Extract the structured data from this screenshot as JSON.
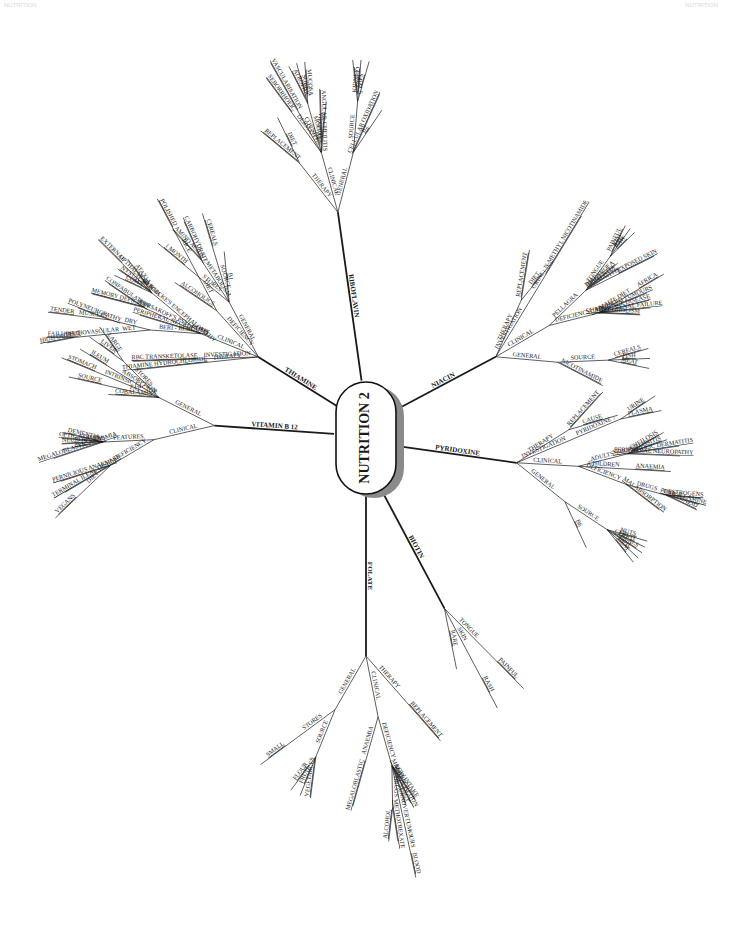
{
  "page": {
    "header_left": "NUTRITION",
    "header_right": "NUTRITION"
  },
  "center": {
    "label": "NUTRITION 2"
  },
  "branches": [
    {
      "label": "THIAMINE",
      "children": [
        {
          "label": "GENERAL",
          "children": [
            {
              "label": "B1"
            },
            {
              "label": "SOURCE",
              "children": [
                {
                  "label": "CEREALS"
                }
              ]
            },
            {
              "label": "METABOLISM",
              "children": [
                {
                  "label": "CARBOHYDRATE"
                },
                {
                  "label": "AMINO ACIDS"
                }
              ]
            },
            {
              "label": "STORES",
              "children": [
                {
                  "label": "1 MONTH"
                }
              ]
            }
          ]
        },
        {
          "label": "DEFICIENCY",
          "children": [
            {
              "label": "DIET",
              "children": [
                {
                  "label": "RICE",
                  "children": [
                    {
                      "label": "POLISHED"
                    }
                  ]
                }
              ]
            },
            {
              "label": "ALCOHOLICS"
            }
          ]
        },
        {
          "label": "CLINICAL",
          "children": [
            {
              "label": "WERNICKE'S ENCEPHALOPATHY",
              "children": [
                {
                  "label": "ATAXIA"
                },
                {
                  "label": "OPTHALMOPLEGIA",
                  "children": [
                    {
                      "label": "EXTERNAL"
                    }
                  ]
                },
                {
                  "label": "NYSTAGMUS"
                },
                {
                  "label": "COMA"
                }
              ]
            },
            {
              "label": "KORSAKOFF'S PSYCHOSIS",
              "children": [
                {
                  "label": "CONFABULATION"
                },
                {
                  "label": "MEMORY DEFICITS"
                }
              ]
            },
            {
              "label": "PERIPHERAL NEUROPATHY"
            },
            {
              "label": "BERI - BERI",
              "children": [
                {
                  "label": "DRY",
                  "children": [
                    {
                      "label": "POLYNEUROPATHY"
                    },
                    {
                      "label": "MUSCLES",
                      "children": [
                        {
                          "label": "TENDER"
                        }
                      ]
                    }
                  ]
                },
                {
                  "label": "WET",
                  "children": [
                    {
                      "label": "CARDIOVASCULAR",
                      "children": [
                        {
                          "label": "FAILURE"
                        },
                        {
                          "label": "HIGH OUTPUT"
                        }
                      ]
                    }
                  ]
                }
              ]
            }
          ]
        },
        {
          "label": "INVESTIGATION",
          "children": [
            {
              "label": "RBC TRANSKETOLASE"
            }
          ]
        },
        {
          "label": "THERAPY",
          "children": [
            {
              "label": "THIAMINE HYDROCHLORIDE"
            }
          ]
        }
      ]
    },
    {
      "label": "RIBOFLAVIN",
      "children": [
        {
          "label": "GENERAL",
          "children": [
            {
              "label": "B2"
            },
            {
              "label": "CELLULAR OXIDATION"
            },
            {
              "label": "SOURCE",
              "children": [
                {
                  "label": "FATS"
                },
                {
                  "label": "KIDNEY"
                },
                {
                  "label": "CEREALS"
                }
              ]
            }
          ]
        },
        {
          "label": "CLINICAL",
          "children": [
            {
              "label": "ANAEMIA"
            },
            {
              "label": "ANGULAR CHEILITIS"
            },
            {
              "label": "MOUTH",
              "children": [
                {
                  "label": "MUCOSA"
                },
                {
                  "label": "SORE"
                },
                {
                  "label": "ATROPHIC"
                }
              ]
            },
            {
              "label": "CORNEA",
              "children": [
                {
                  "label": "VASCULARISATION"
                }
              ]
            },
            {
              "label": "DERMATITIS",
              "children": [
                {
                  "label": "SEBORRHOEIC"
                }
              ]
            }
          ]
        },
        {
          "label": "THERAPY",
          "children": [
            {
              "label": "DIET"
            },
            {
              "label": "REPLACEMENT"
            }
          ]
        }
      ]
    },
    {
      "label": "NIACIN",
      "children": [
        {
          "label": "GENERAL",
          "children": [
            {
              "label": "NICOTINAMIDE"
            },
            {
              "label": "SOURCE",
              "children": [
                {
                  "label": "MEAT"
                },
                {
                  "label": "FISH"
                },
                {
                  "label": "CEREALS"
                }
              ]
            }
          ]
        },
        {
          "label": "CLINICAL",
          "children": [
            {
              "label": "DEFICIENCY",
              "children": [
                {
                  "label": "ALCOHOLISM"
                },
                {
                  "label": "CHRONIC RENAL FAILURE"
                },
                {
                  "label": "HARTNUP DISEASE"
                },
                {
                  "label": "CARCINOID TUMOURS"
                },
                {
                  "label": "MAIZE DIET",
                  "children": [
                    {
                      "label": "AFRICA"
                    }
                  ]
                }
              ]
            },
            {
              "label": "PELLAGRA",
              "children": [
                {
                  "label": "DERMATITIS",
                  "children": [
                    {
                      "label": "EXPOSED SKIN"
                    }
                  ]
                },
                {
                  "label": "DEMENTIA"
                },
                {
                  "label": "DIARRHOEA"
                },
                {
                  "label": "TONGUE",
                  "children": [
                    {
                      "label": "RAW"
                    },
                    {
                      "label": "RED"
                    },
                    {
                      "label": "PAINFUL"
                    }
                  ]
                }
              ]
            }
          ]
        },
        {
          "label": "INVESTIGATION",
          "children": [
            {
              "label": "URINE",
              "children": [
                {
                  "label": "↓ N-METHYL NICOTINAMIDE"
                }
              ]
            }
          ]
        },
        {
          "label": "THERAPY",
          "children": [
            {
              "label": "DIET"
            },
            {
              "label": "REPLACEMENT"
            }
          ]
        }
      ]
    },
    {
      "label": "PYRIDOXINE",
      "children": [
        {
          "label": "GENERAL",
          "children": [
            {
              "label": "B6"
            },
            {
              "label": "SOURCE",
              "children": [
                {
                  "label": "MEAT"
                },
                {
                  "label": "FISH"
                },
                {
                  "label": "CEREALS"
                },
                {
                  "label": "FRUIT"
                },
                {
                  "label": "NUTS"
                }
              ]
            }
          ]
        },
        {
          "label": "CLINICAL",
          "children": [
            {
              "label": "DEFICIENCY",
              "children": [
                {
                  "label": "MALABSORPTION"
                },
                {
                  "label": "DRUGS",
                  "children": [
                    {
                      "label": "ISONIAZID"
                    },
                    {
                      "label": "PENICILLAMINE"
                    },
                    {
                      "label": "OESTROGENS"
                    }
                  ]
                }
              ]
            },
            {
              "label": "CHILDREN",
              "children": [
                {
                  "label": "ANAEMIA"
                }
              ]
            },
            {
              "label": "ADULTS",
              "children": [
                {
                  "label": "PERIPHERAL NEUROPATHY"
                },
                {
                  "label": "SEBORRHOEIC DERMATITIS"
                },
                {
                  "label": "GLOSSITIS"
                },
                {
                  "label": "CHEILOSIS"
                }
              ]
            }
          ]
        },
        {
          "label": "INVESTIGATION",
          "children": [
            {
              "label": "PYRIDOXINE ↓",
              "children": [
                {
                  "label": "PLASMA"
                },
                {
                  "label": "URINE"
                }
              ]
            }
          ]
        },
        {
          "label": "THERAPY",
          "children": [
            {
              "label": "CAUSE"
            },
            {
              "label": "REPLACEMENT"
            }
          ]
        }
      ]
    },
    {
      "label": "BIOTIN",
      "children": [
        {
          "label": "RARE"
        },
        {
          "label": "SKIN",
          "children": [
            {
              "label": "RASH"
            }
          ]
        },
        {
          "label": "TONGUE",
          "children": [
            {
              "label": "PAINFUL"
            }
          ]
        }
      ]
    },
    {
      "label": "FOLATE",
      "children": [
        {
          "label": "GENERAL",
          "children": [
            {
              "label": "STORES",
              "children": [
                {
                  "label": "SMALL"
                }
              ]
            },
            {
              "label": "SOURCE",
              "children": [
                {
                  "label": "FLOUR"
                },
                {
                  "label": "FRUIT"
                },
                {
                  "label": "VEGETABLES"
                }
              ]
            }
          ]
        },
        {
          "label": "CLINICAL",
          "children": [
            {
              "label": "ANAEMIA",
              "children": [
                {
                  "label": "MEGALOBLASTIC"
                }
              ]
            },
            {
              "label": "DEFICIENCY",
              "children": [
                {
                  "label": "DRUGS",
                  "children": [
                    {
                      "label": "ALCOHOL"
                    },
                    {
                      "label": "METHOTREXATE"
                    }
                  ]
                },
                {
                  "label": "↑ CELL TURNOVER",
                  "children": [
                    {
                      "label": "TUMOURS",
                      "children": [
                        {
                          "label": "BLOOD"
                        }
                      ]
                    }
                  ]
                },
                {
                  "label": "PREGNANCY"
                },
                {
                  "label": "MALABSORPTION"
                },
                {
                  "label": "LOW INTAKE"
                }
              ]
            }
          ]
        },
        {
          "label": "THERAPY",
          "children": [
            {
              "label": "REPLACEMENT"
            }
          ]
        }
      ]
    },
    {
      "label": "VITAMIN B 12",
      "children": [
        {
          "label": "GENERAL",
          "children": [
            {
              "label": "STORES",
              "children": [
                {
                  "label": "LARGE"
                },
                {
                  "label": "LIVER"
                }
              ]
            },
            {
              "label": "ABSORPTION",
              "children": [
                {
                  "label": "ILEUM"
                }
              ]
            },
            {
              "label": "INTRINSIC FACTOR",
              "children": [
                {
                  "label": "STOMACH"
                }
              ]
            },
            {
              "label": "FAT",
              "children": [
                {
                  "label": "SOURCE"
                }
              ]
            },
            {
              "label": "COBALAMIN"
            }
          ]
        },
        {
          "label": "CLINICAL",
          "children": [
            {
              "label": "FEATURES",
              "children": [
                {
                  "label": "DEMENTIA"
                },
                {
                  "label": "OPTIC ATROPHY"
                },
                {
                  "label": "NEUROPATHY"
                },
                {
                  "label": "SCDC"
                },
                {
                  "label": "MEGALOBLASTIC ANAEMIA"
                }
              ]
            },
            {
              "label": "DEFICIENCY",
              "children": [
                {
                  "label": "PERNICIOUS ANAEMIA"
                },
                {
                  "label": "TERMINAL ILEAL DISEASE"
                },
                {
                  "label": "DIET",
                  "children": [
                    {
                      "label": "VEGANS"
                    }
                  ]
                }
              ]
            }
          ]
        }
      ]
    }
  ]
}
